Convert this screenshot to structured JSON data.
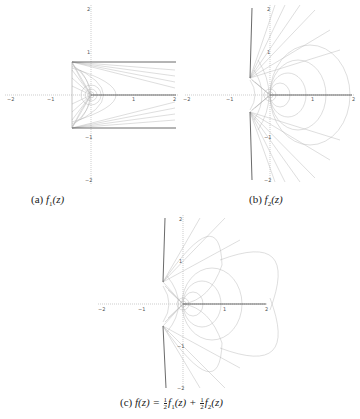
{
  "figure": {
    "panels": [
      {
        "id": "a",
        "caption_label": "(a)",
        "caption_func": "f",
        "caption_sub": "1",
        "caption_arg": "(z)",
        "x_ticks": [
          "−2",
          "−1",
          "1",
          "2"
        ],
        "y_ticks": [
          "2",
          "1",
          "−1",
          "−2"
        ]
      },
      {
        "id": "b",
        "caption_label": "(b)",
        "caption_func": "f",
        "caption_sub": "2",
        "caption_arg": "(z)",
        "x_ticks": [
          "−2",
          "−1",
          "1",
          "2"
        ],
        "y_ticks": [
          "2",
          "1",
          "−1",
          "−2"
        ]
      },
      {
        "id": "c",
        "caption_label": "(c)",
        "caption_lhs": "f(z) =",
        "caption_frac_num": "1",
        "caption_frac_den": "2",
        "caption_term1": "f",
        "caption_term1_sub": "1",
        "caption_term1_arg": "(z) +",
        "caption_term2": "f",
        "caption_term2_sub": "2",
        "caption_term2_arg": "(z)",
        "x_ticks": [
          "−2",
          "−1",
          "1",
          "2"
        ],
        "y_ticks": [
          "2",
          "1",
          "−1",
          "−2"
        ]
      }
    ],
    "colors": {
      "axis": "#9a9a9a",
      "curve": "#b5b5b5",
      "boundary": "#444444"
    }
  }
}
